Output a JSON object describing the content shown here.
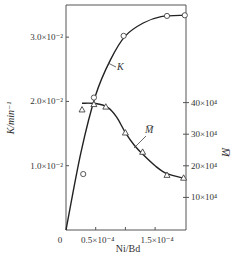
{
  "chart_data": {
    "type": "line",
    "title": "",
    "xlabel": "Ni/Bd",
    "ylabel": "K/min⁻¹",
    "y2label": "M̅",
    "xlim": [
      0,
      0.000202
    ],
    "ylim": [
      0,
      0.035
    ],
    "y2lim": [
      0,
      460000.0
    ],
    "grid": false,
    "legend": "inline curve labels",
    "x_ticks": [
      {
        "value": 0,
        "label": "0"
      },
      {
        "value": 5e-05,
        "label": "0.5×10⁻⁴"
      },
      {
        "value": 0.0001,
        "label": ""
      },
      {
        "value": 0.00015,
        "label": "1.5×10⁻⁴"
      }
    ],
    "y_ticks": [
      {
        "value": 0.01,
        "label": "1.0×10⁻²"
      },
      {
        "value": 0.02,
        "label": "2.0×10⁻²"
      },
      {
        "value": 0.03,
        "label": "3.0×10⁻²"
      }
    ],
    "y2_ticks": [
      {
        "value": 100000.0,
        "label": "10×10⁴"
      },
      {
        "value": 200000.0,
        "label": "20×10⁴"
      },
      {
        "value": 300000.0,
        "label": "30×10⁴"
      },
      {
        "value": 400000.0,
        "label": "40×10⁴"
      }
    ],
    "series": [
      {
        "name": "K",
        "axis": "left",
        "marker": "circle",
        "points": [
          [
            2.9e-05,
            0.0087
          ],
          [
            4.7e-05,
            0.0206
          ],
          [
            9.7e-05,
            0.0302
          ],
          [
            0.00017,
            0.0333
          ],
          [
            0.0002,
            0.0334
          ]
        ],
        "curve": [
          [
            0,
            0
          ],
          [
            2.5e-05,
            0.012
          ],
          [
            5e-05,
            0.021
          ],
          [
            7.5e-05,
            0.0265
          ],
          [
            0.0001,
            0.0302
          ],
          [
            0.00013,
            0.0322
          ],
          [
            0.00016,
            0.0332
          ],
          [
            0.0002,
            0.0334
          ]
        ]
      },
      {
        "name": "M̅",
        "axis": "right",
        "marker": "triangle",
        "points": [
          [
            2.7e-05,
            378000.0
          ],
          [
            4.7e-05,
            395000.0
          ],
          [
            6.7e-05,
            387000.0
          ],
          [
            0.0001,
            305000.0
          ],
          [
            0.000129,
            244000.0
          ],
          [
            0.00017,
            171000.0
          ],
          [
            0.000198,
            162000.0
          ]
        ],
        "curve": [
          [
            2.7e-05,
            398000.0
          ],
          [
            5e-05,
            397000.0
          ],
          [
            7e-05,
            385000.0
          ],
          [
            8.5e-05,
            355000.0
          ],
          [
            0.0001,
            305000.0
          ],
          [
            0.000115,
            265000.0
          ],
          [
            0.00013,
            235000.0
          ],
          [
            0.00015,
            200000.0
          ],
          [
            0.00017,
            175000.0
          ],
          [
            0.0002,
            160000.0
          ]
        ]
      }
    ],
    "annotations": [
      {
        "text": "K",
        "series": "K"
      },
      {
        "text": "M̅",
        "series": "M̅"
      }
    ]
  }
}
